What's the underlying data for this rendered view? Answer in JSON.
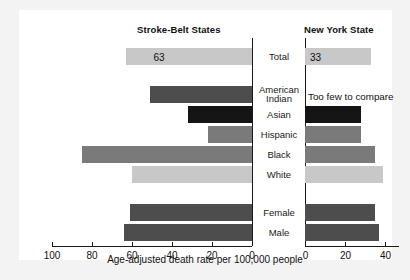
{
  "figure": {
    "left_title": "Stroke-Belt States",
    "right_title": "New York State",
    "x_caption": "Age-adjusted death rate per 100,000 people",
    "note_right": "Too few to compare"
  },
  "colors": {
    "light_gray": "#c8c8c8",
    "mid_gray": "#7a7a7a",
    "dark_gray": "#4d4d4d",
    "black": "#151515",
    "axis": "#1a1a1a",
    "plate": "#ffffff",
    "page": "#f3f3f3"
  },
  "chart_data": {
    "type": "bar",
    "orientation": "horizontal",
    "layout": "back-to-back paired panels with shared centered category labels",
    "xlabel": "Age-adjusted death rate per 100,000 people",
    "ylabel": "",
    "grid": false,
    "legend": null,
    "panels": [
      {
        "name": "Stroke-Belt States",
        "direction": "left",
        "xlim": [
          0,
          100
        ],
        "ticks": [
          100,
          80,
          60,
          40,
          20,
          0
        ],
        "tick_labels": [
          "100",
          "80",
          "60",
          "40",
          "20",
          "0"
        ]
      },
      {
        "name": "New York State",
        "direction": "right",
        "xlim": [
          0,
          47
        ],
        "ticks": [
          0,
          20,
          40
        ],
        "tick_labels": [
          "0",
          "20",
          "40"
        ]
      }
    ],
    "categories": [
      "Total",
      "American Indian",
      "Asian",
      "Hispanic",
      "Black",
      "White",
      "Female",
      "Male"
    ],
    "series": [
      {
        "name": "Stroke-Belt States",
        "values": [
          63,
          51,
          32,
          22,
          85,
          60,
          61,
          64
        ]
      },
      {
        "name": "New York State",
        "values": [
          33,
          null,
          28,
          28,
          35,
          39,
          35,
          37
        ]
      }
    ],
    "data_labels": {
      "Stroke-Belt States": {
        "Total": "63"
      },
      "New York State": {
        "Total": "33"
      }
    },
    "annotations": [
      {
        "panel": "New York State",
        "category": "American Indian",
        "text": "Too few to compare"
      }
    ]
  },
  "rows": [
    {
      "label": "Total",
      "label_lines": [
        "Total"
      ],
      "top": 38,
      "left_value": 63,
      "left_label": "63",
      "left_color": "#c8c8c8",
      "right_value": 33,
      "right_label": "33",
      "right_color": "#c8c8c8"
    },
    {
      "label": "American Indian",
      "label_lines": [
        "American",
        "Indian"
      ],
      "top": 76,
      "left_value": 51,
      "left_label": "",
      "left_color": "#4d4d4d",
      "right_value": null,
      "right_label": "",
      "right_color": ""
    },
    {
      "label": "Asian",
      "label_lines": [
        "Asian"
      ],
      "top": 96,
      "left_value": 32,
      "left_label": "",
      "left_color": "#151515",
      "right_value": 28,
      "right_label": "",
      "right_color": "#151515"
    },
    {
      "label": "Hispanic",
      "label_lines": [
        "Hispanic"
      ],
      "top": 116,
      "left_value": 22,
      "left_label": "",
      "left_color": "#7a7a7a",
      "right_value": 28,
      "right_label": "",
      "right_color": "#7a7a7a"
    },
    {
      "label": "Black",
      "label_lines": [
        "Black"
      ],
      "top": 136,
      "left_value": 85,
      "left_label": "",
      "left_color": "#7a7a7a",
      "right_value": 35,
      "right_label": "",
      "right_color": "#7a7a7a"
    },
    {
      "label": "White",
      "label_lines": [
        "White"
      ],
      "top": 156,
      "left_value": 60,
      "left_label": "",
      "left_color": "#c8c8c8",
      "right_value": 39,
      "right_label": "",
      "right_color": "#c8c8c8"
    },
    {
      "label": "Female",
      "label_lines": [
        "Female"
      ],
      "top": 194,
      "left_value": 61,
      "left_label": "",
      "left_color": "#4d4d4d",
      "right_value": 35,
      "right_label": "",
      "right_color": "#4d4d4d"
    },
    {
      "label": "Male",
      "label_lines": [
        "Male"
      ],
      "top": 214,
      "left_value": 64,
      "left_label": "",
      "left_color": "#4d4d4d",
      "right_value": 37,
      "right_label": "",
      "right_color": "#4d4d4d"
    }
  ]
}
